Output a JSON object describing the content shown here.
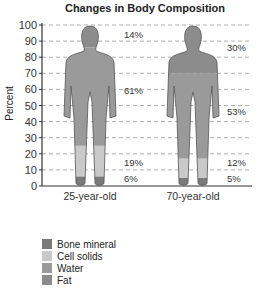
{
  "chart_data": {
    "type": "bar",
    "subtype": "stacked pictogram",
    "title": "Changes in Body Composition",
    "xlabel": "",
    "ylabel": "Percent",
    "ylim": [
      0,
      100
    ],
    "yticks": [
      0,
      10,
      20,
      30,
      40,
      50,
      60,
      70,
      80,
      90,
      100
    ],
    "grid": true,
    "categories": [
      "25-year-old",
      "70-year-old"
    ],
    "series": [
      {
        "name": "Bone mineral",
        "values": [
          6,
          5
        ],
        "color": "#7a7a7a"
      },
      {
        "name": "Cell solids",
        "values": [
          19,
          12
        ],
        "color": "#c9c9c9"
      },
      {
        "name": "Water",
        "values": [
          61,
          53
        ],
        "color": "#9a9a9a"
      },
      {
        "name": "Fat",
        "values": [
          14,
          30
        ],
        "color": "#8c8c8c"
      }
    ],
    "legend_position": "bottom-left"
  },
  "labels": {
    "fig1": [
      "14%",
      "61%",
      "19%",
      "6%"
    ],
    "fig2": [
      "30%",
      "53%",
      "12%",
      "5%"
    ]
  }
}
